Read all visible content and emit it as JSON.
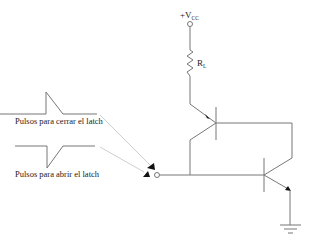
{
  "diagram": {
    "type": "circuit-schematic",
    "supply": {
      "label": "+V",
      "subscript": "CC"
    },
    "resistor": {
      "label": "R",
      "subscript": "L"
    },
    "pulses": [
      {
        "label": "Pulsos para cerrar el latch",
        "polarity": "positive"
      },
      {
        "label": "Pulsos para abrir el latch",
        "polarity": "negative"
      }
    ],
    "transistors": [
      {
        "name": "top-transistor",
        "type": "PNP"
      },
      {
        "name": "bottom-transistor",
        "type": "NPN"
      }
    ],
    "ground": "ground-symbol",
    "colors": {
      "wire": "#777777",
      "text": "#222222",
      "arrow": "#111111",
      "guide": "#cfcfcf"
    }
  }
}
